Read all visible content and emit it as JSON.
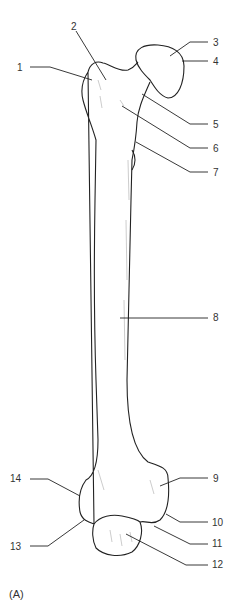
{
  "diagram": {
    "caption": "(A)",
    "labels": [
      {
        "id": "1",
        "text": "1",
        "x": 17,
        "y": 63,
        "side": "left"
      },
      {
        "id": "2",
        "text": "2",
        "x": 71,
        "y": 22,
        "side": "top"
      },
      {
        "id": "3",
        "text": "3",
        "x": 213,
        "y": 39,
        "side": "right"
      },
      {
        "id": "4",
        "text": "4",
        "x": 213,
        "y": 57,
        "side": "right"
      },
      {
        "id": "5",
        "text": "5",
        "x": 213,
        "y": 120,
        "side": "right"
      },
      {
        "id": "6",
        "text": "6",
        "x": 213,
        "y": 144,
        "side": "right"
      },
      {
        "id": "7",
        "text": "7",
        "x": 213,
        "y": 168,
        "side": "right"
      },
      {
        "id": "8",
        "text": "8",
        "x": 213,
        "y": 313,
        "side": "right"
      },
      {
        "id": "9",
        "text": "9",
        "x": 213,
        "y": 476,
        "side": "right"
      },
      {
        "id": "10",
        "text": "10",
        "x": 213,
        "y": 519,
        "side": "right"
      },
      {
        "id": "11",
        "text": "11",
        "x": 213,
        "y": 540,
        "side": "right"
      },
      {
        "id": "12",
        "text": "12",
        "x": 213,
        "y": 561,
        "side": "right"
      },
      {
        "id": "13",
        "text": "13",
        "x": 10,
        "y": 543,
        "side": "left"
      },
      {
        "id": "14",
        "text": "14",
        "x": 10,
        "y": 475,
        "side": "left"
      }
    ],
    "colors": {
      "line": "#222222",
      "text": "#333333",
      "background": "#ffffff"
    }
  }
}
